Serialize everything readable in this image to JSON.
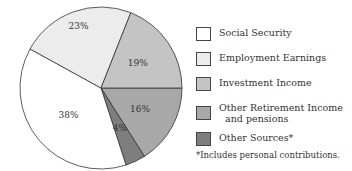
{
  "chart_data": {
    "type": "pie",
    "title": "",
    "categories": [
      "Social Security",
      "Employment Earnings",
      "Investment Income",
      "Other Retirement Income and pensions",
      "Other Sources*"
    ],
    "values": [
      38,
      23,
      19,
      16,
      4
    ],
    "labels": [
      "38%",
      "23%",
      "19%",
      "16%",
      "4%"
    ],
    "colors": [
      "#ffffff",
      "#ececec",
      "#c4c4c4",
      "#a8a8a8",
      "#7e7e7e"
    ],
    "legend_position": "right",
    "footnote": "*Includes personal contributions."
  },
  "legend": {
    "items": [
      {
        "label": "Social Security",
        "color": "#ffffff"
      },
      {
        "label": "Employment Earnings",
        "color": "#ececec"
      },
      {
        "label": "Investment Income",
        "color": "#c4c4c4"
      },
      {
        "label": "Other Retirement Income\n  and pensions",
        "color": "#a8a8a8"
      },
      {
        "label": "Other Sources*",
        "color": "#7e7e7e"
      }
    ]
  },
  "footnote": "*Includes personal contributions."
}
